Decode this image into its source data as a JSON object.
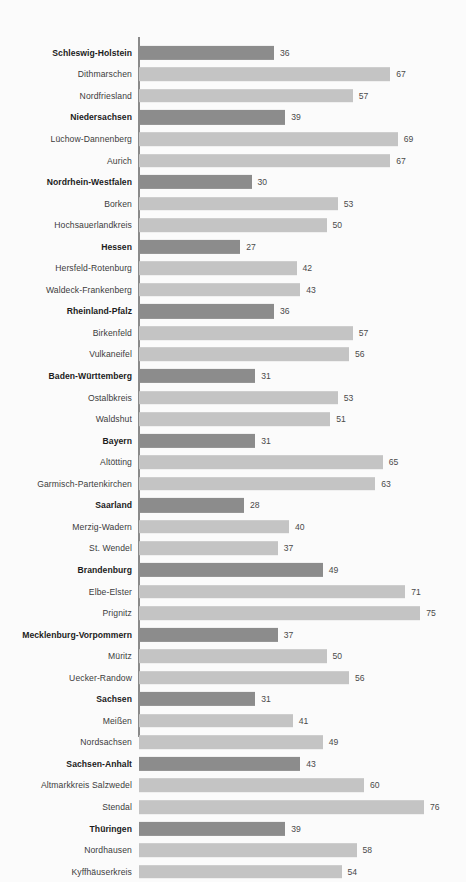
{
  "chart_data": {
    "type": "bar",
    "orientation": "horizontal",
    "title": "",
    "xlabel": "",
    "ylabel": "",
    "xlim": [
      0,
      76
    ],
    "grid": false,
    "legend": null,
    "categories": [
      "Schleswig-Holstein",
      "Dithmarschen",
      "Nordfriesland",
      "Niedersachsen",
      "Lüchow-Dannenberg",
      "Aurich",
      "Nordrhein-Westfalen",
      "Borken",
      "Hochsauerlandkreis",
      "Hessen",
      "Hersfeld-Rotenburg",
      "Waldeck-Frankenberg",
      "Rheinland-Pfalz",
      "Birkenfeld",
      "Vulkaneifel",
      "Baden-Württemberg",
      "Ostalbkreis",
      "Waldshut",
      "Bayern",
      "Altötting",
      "Garmisch-Partenkirchen",
      "Saarland",
      "Merzig-Wadern",
      "St. Wendel",
      "Brandenburg",
      "Elbe-Elster",
      "Prignitz",
      "Mecklenburg-Vorpommern",
      "Müritz",
      "Uecker-Randow",
      "Sachsen",
      "Meißen",
      "Nordsachsen",
      "Sachsen-Anhalt",
      "Altmarkkreis Salzwedel",
      "Stendal",
      "Thüringen",
      "Nordhausen",
      "Kyffhäuserkreis"
    ],
    "values": [
      36,
      67,
      57,
      39,
      69,
      67,
      30,
      53,
      50,
      27,
      42,
      43,
      36,
      57,
      56,
      31,
      53,
      51,
      31,
      65,
      63,
      28,
      40,
      37,
      49,
      71,
      75,
      37,
      50,
      56,
      31,
      41,
      49,
      43,
      60,
      76,
      39,
      58,
      54
    ],
    "emphasis": [
      true,
      false,
      false,
      true,
      false,
      false,
      true,
      false,
      false,
      true,
      false,
      false,
      true,
      false,
      false,
      true,
      false,
      false,
      true,
      false,
      false,
      true,
      false,
      false,
      true,
      false,
      false,
      true,
      false,
      false,
      true,
      false,
      false,
      true,
      false,
      false,
      true,
      false,
      false
    ],
    "colors": {
      "state_bar": "#8c8c8c",
      "district_bar": "#c4c4c4",
      "axis": "#8a8a8a",
      "background": "#fbfbfb",
      "label_text": "#3b3b3b",
      "state_label_text": "#1c1c1c",
      "value_text": "#4a4a4a"
    }
  }
}
